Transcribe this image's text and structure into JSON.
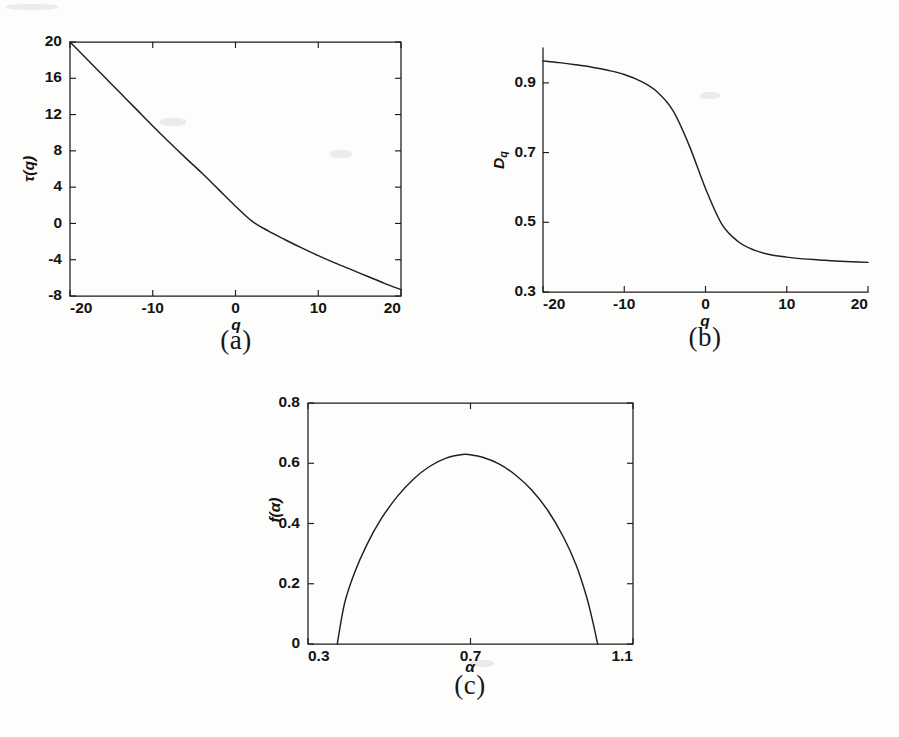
{
  "figure": {
    "background_color": "#fdfdfc",
    "ink_color": "#1f1f1f",
    "panel_captions": {
      "a": "(a)",
      "b": "(b)",
      "c": "(c)"
    }
  },
  "chart_data": [
    {
      "id": "panel-a",
      "type": "line",
      "title": "",
      "xlabel": "q",
      "ylabel": "τ(q)",
      "xlim": [
        -20,
        20
      ],
      "ylim": [
        -8,
        20
      ],
      "xticks": [
        -20,
        -10,
        0,
        10,
        20
      ],
      "xtick_labels": [
        "-20",
        "-10",
        "0",
        "10",
        "20"
      ],
      "yticks": [
        -8,
        -4,
        0,
        4,
        8,
        12,
        16,
        20
      ],
      "ytick_labels": [
        "-8",
        "-4",
        "0",
        "4",
        "8",
        "12",
        "16",
        "20"
      ],
      "grid": false,
      "legend": "none",
      "box": "full",
      "series": [
        {
          "name": "tau(q)",
          "x": [
            -20,
            -18,
            -16,
            -14,
            -12,
            -10,
            -8,
            -6,
            -4,
            -2,
            0,
            2,
            4,
            6,
            8,
            10,
            12,
            14,
            16,
            18,
            20
          ],
          "y": [
            20.0,
            18.15,
            16.3,
            14.45,
            12.6,
            10.75,
            8.95,
            7.2,
            5.5,
            3.7,
            1.9,
            0.25,
            -0.85,
            -1.8,
            -2.7,
            -3.55,
            -4.35,
            -5.1,
            -5.85,
            -6.6,
            -7.3
          ]
        }
      ]
    },
    {
      "id": "panel-b",
      "type": "line",
      "title": "",
      "xlabel": "q",
      "ylabel": "D_q",
      "xlim": [
        -20,
        20
      ],
      "ylim": [
        0.3,
        1.0
      ],
      "xticks": [
        -20,
        -10,
        0,
        10,
        20
      ],
      "xtick_labels": [
        "-20",
        "-10",
        "0",
        "10",
        "20"
      ],
      "yticks": [
        0.3,
        0.5,
        0.7,
        0.9
      ],
      "ytick_labels": [
        "0.3",
        "0.5",
        "0.7",
        "0.9"
      ],
      "grid": false,
      "legend": "none",
      "box": "left-bottom",
      "series": [
        {
          "name": "D_q",
          "x": [
            -20,
            -18,
            -16,
            -14,
            -12,
            -10,
            -8,
            -6,
            -4,
            -2,
            0,
            2,
            4,
            6,
            8,
            10,
            12,
            14,
            16,
            18,
            20
          ],
          "y": [
            0.963,
            0.958,
            0.952,
            0.945,
            0.936,
            0.924,
            0.905,
            0.875,
            0.82,
            0.72,
            0.597,
            0.495,
            0.445,
            0.42,
            0.407,
            0.4,
            0.395,
            0.392,
            0.389,
            0.387,
            0.385
          ]
        }
      ]
    },
    {
      "id": "panel-c",
      "type": "line",
      "title": "",
      "xlabel": "α",
      "ylabel": "f(α)",
      "xlim": [
        0.3,
        1.1
      ],
      "ylim": [
        0.0,
        0.8
      ],
      "xticks": [
        0.3,
        0.7,
        1.1
      ],
      "xtick_labels": [
        "0.3",
        "0.7",
        "1.1"
      ],
      "yticks": [
        0.0,
        0.2,
        0.4,
        0.6,
        0.8
      ],
      "ytick_labels": [
        "0",
        "0.2",
        "0.4",
        "0.6",
        "0.8"
      ],
      "grid": false,
      "legend": "none",
      "box": "full",
      "series": [
        {
          "name": "f(alpha)",
          "x": [
            0.372,
            0.39,
            0.415,
            0.445,
            0.48,
            0.52,
            0.56,
            0.6,
            0.64,
            0.68,
            0.7,
            0.73,
            0.77,
            0.81,
            0.85,
            0.89,
            0.93,
            0.96,
            0.985,
            1.0,
            1.013
          ],
          "y": [
            0.0,
            0.135,
            0.238,
            0.33,
            0.415,
            0.49,
            0.548,
            0.59,
            0.617,
            0.629,
            0.628,
            0.62,
            0.598,
            0.562,
            0.512,
            0.444,
            0.352,
            0.262,
            0.16,
            0.08,
            0.0
          ]
        }
      ]
    }
  ]
}
